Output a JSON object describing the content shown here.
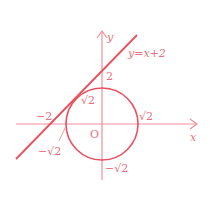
{
  "diagram": {
    "colors": {
      "axes": "#ef8f98",
      "curve": "#e8505e",
      "text": "#e8707c"
    },
    "axes": {
      "x_label": "x",
      "y_label": "y",
      "origin_label": "O"
    },
    "line": {
      "equation": "y=x+2",
      "x_intercept_label": "−2",
      "y_intercept_label": "2"
    },
    "circle": {
      "radius_label_right": "√2",
      "radius_label_top": "√2",
      "radius_label_bottom": "−√2",
      "radius_label_left": "−√2"
    }
  }
}
